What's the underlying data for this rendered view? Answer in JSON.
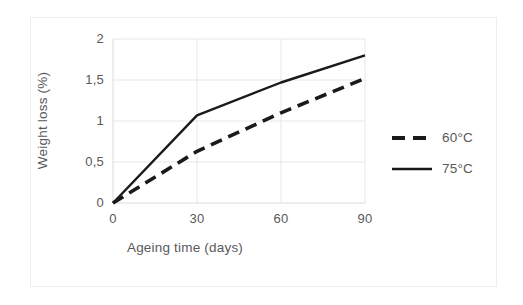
{
  "chart_data": {
    "type": "line",
    "title": "",
    "subtitle": "",
    "xlabel": "Ageing time (days)",
    "ylabel": "Weight loss (%)",
    "x": [
      0,
      30,
      60,
      90
    ],
    "xlim": [
      0,
      90
    ],
    "ylim": [
      0,
      2
    ],
    "xticks": [
      "0",
      "30",
      "60",
      "90"
    ],
    "yticks": [
      "0",
      "0,5",
      "1",
      "1,5",
      "2"
    ],
    "xtick_values": [
      0,
      30,
      60,
      90
    ],
    "ytick_values": [
      0,
      0.5,
      1,
      1.5,
      2
    ],
    "grid": "both",
    "legend_position": "right",
    "series": [
      {
        "name": "60°C",
        "style": "dashed",
        "color": "#1a1a1a",
        "values": [
          0,
          0.63,
          1.1,
          1.52
        ]
      },
      {
        "name": "75°C",
        "style": "solid",
        "color": "#1a1a1a",
        "values": [
          0,
          1.07,
          1.47,
          1.8
        ]
      }
    ],
    "annotations": []
  },
  "axes": {
    "x_title": "Ageing time (days)",
    "y_title": "Weight loss (%)",
    "x_ticks": [
      "0",
      "30",
      "60",
      "90"
    ],
    "y_ticks": [
      "0",
      "0,5",
      "1",
      "1,5",
      "2"
    ]
  },
  "legend": {
    "items": [
      {
        "label": "60°C",
        "style": "dashed"
      },
      {
        "label": "75°C",
        "style": "solid"
      }
    ]
  },
  "colors": {
    "series_line": "#1a1a1a",
    "grid": "#e4e7ea",
    "axis_text": "#595959",
    "figure_border": "#eceef0",
    "background": "#ffffff"
  }
}
